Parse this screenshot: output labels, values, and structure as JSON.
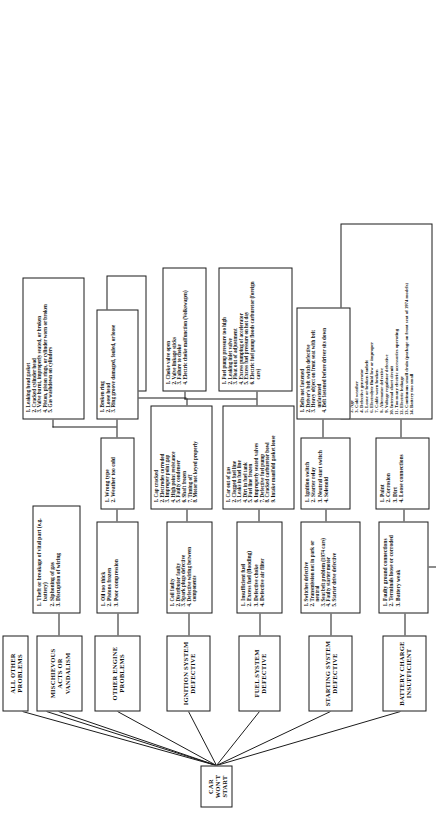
{
  "diagram": {
    "title": "CAR WON'T START",
    "type": "fault-tree",
    "orientation": "rotated-90-ccw",
    "root": {
      "label": "CAR WON'T START"
    },
    "branches": [
      {
        "id": "battery",
        "head": "BATTERY CHARGE INSUFFICIENT",
        "level2": [
          "Faulty ground connections",
          "Terminals loose or corroded",
          "Battery weak"
        ],
        "level3": [
          "Paint",
          "Corrosion",
          "Dirt",
          "Loose connections"
        ],
        "level4": [
          "Lights left on, motor off",
          "Age",
          "Cold weather",
          "Defective generator",
          "Loose or broken fanbelt",
          "Electrolyte fluid low or improper",
          "Cable worn broken",
          "Alternator defective",
          "Voltage regulator defective",
          "Internal short circuit",
          "Too many electric accessories operating",
          "Electric leakage",
          "Continuous small drain (package on front seat of 1974 models)",
          "Battery too small"
        ]
      },
      {
        "id": "starting",
        "head": "STARTING SYSTEM DEFECTIVE",
        "level2": [
          "Switches defective",
          "Transmission not in park or neutral",
          "Seat belt problem (1974 cars)",
          "Faulty starter motor",
          "Starter drive defective"
        ],
        "level3": [
          "Ignition switch",
          "Starter relay",
          "Neutral start switch",
          "Solenoid"
        ],
        "level4": [
          "Belts not fastened",
          "Driver's belt switch defective",
          "Heavy object on front seat with belt unfastened",
          "Belt fastened before driver sits down"
        ]
      },
      {
        "id": "fuel",
        "head": "FUEL SYSTEM DEFECTIVE",
        "level2": [
          "Insufficient fuel",
          "Excess fuel (flooding)",
          "Defective choke",
          "Defective air filter"
        ],
        "level3": [
          "Car out of gas",
          "Clogged fuel line",
          "Leaks in fuel line",
          "Dirt in fuel tank",
          "Fuel line frozen",
          "Improperly seated valves",
          "Defective fuel pump",
          "Cracked carburetor bowl",
          "Intake manifold gasket loose"
        ],
        "level4": [
          "Fuel pump pressure too high",
          "Leaking inlet valve",
          "Float out of adjustment",
          "Excess pumping of accelerator",
          "Excess fuel pressure on hot day",
          "Electric fuel pump floods carburetor (foreign cars)"
        ],
        "level5": [
          "Choke valve open",
          "Valve linkage sticks",
          "Failure to choke",
          "Electric choke malfunction (Volkswagen)"
        ]
      },
      {
        "id": "ignition",
        "head": "IGNITION SYSTEM DEFECTIVE",
        "level2": [
          "Coil faulty",
          "Distributor faulty",
          "Spark plugs defective",
          "Defective wiring between components"
        ],
        "level3": [
          "Cap cracked",
          "Electrodes corroded",
          "Improper point gap",
          "High point resistance",
          "Faulty condenser",
          "Shaft frozen",
          "Timing off",
          "Motor not keyed properly"
        ],
        "level4": [
          "Gap incorrect or fouled",
          "Plug shorting",
          "Loose or defective wiring",
          "Plugs firing in wrong order"
        ]
      },
      {
        "id": "other-engine",
        "head": "OTHER ENGINE PROBLEMS",
        "level2": [
          "Oil too thick",
          "Pistons frozen",
          "Poor compression"
        ],
        "level3": [
          "Wrong type",
          "Weather too cold"
        ],
        "level4": [
          "Broken ring",
          "Loose head",
          "Ring groove damaged, fouled, or loose"
        ],
        "level5": [
          "Leaking head gasket",
          "Cracked cylinder head",
          "Valve burnt, improperly seated, or broken",
          "Piston, piston rings, or cylinder worn or broken",
          "Gas washdown on cylinders"
        ]
      },
      {
        "id": "vandalism",
        "head": "MISCHIEVOUS ACTS OR VANDALISM",
        "level2": [
          "Theft or breakage of vital part (e.g. battery)",
          "Siphoning of gas",
          "Disruption of wiring"
        ]
      },
      {
        "id": "all-other",
        "head": "ALL OTHER PROBLEMS",
        "level2": []
      }
    ]
  }
}
